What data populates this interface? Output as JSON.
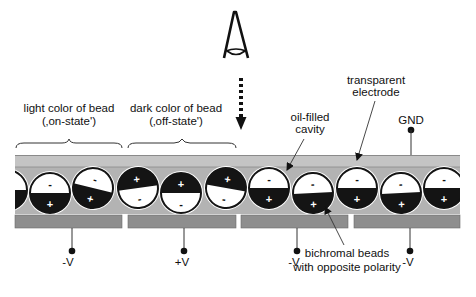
{
  "labels": {
    "on_state_line1": "light color of bead",
    "on_state_line2": "(‚on-state')",
    "off_state_line1": "dark color of bead",
    "off_state_line2": "(‚off-state')",
    "transparent_electrode_line1": "transparent",
    "transparent_electrode_line2": "electrode",
    "oil_cavity_line1": "oil-filled",
    "oil_cavity_line2": "cavity",
    "gnd": "GND",
    "beads_line1": "bichromal beads",
    "beads_line2": "with opposite polarity"
  },
  "electrodes": [
    {
      "label": "-V",
      "x": 72
    },
    {
      "label": "+V",
      "x": 184
    },
    {
      "label": "-V",
      "x": 297
    },
    {
      "label": "-V",
      "x": 410
    }
  ],
  "colors": {
    "top_electrode": "#c4c4c4",
    "cavity": "#b3b3b3",
    "bottom_electrode": "#8e8e8e",
    "bead_dark": "#141414",
    "bead_light": "#ffffff"
  },
  "beads": [
    {
      "cx": 7,
      "cy": 190,
      "dark": "bottom",
      "tilt": 0
    },
    {
      "cx": 50,
      "cy": 193,
      "dark": "bottom",
      "tilt": 0
    },
    {
      "cx": 93,
      "cy": 188,
      "dark": "bottom",
      "tilt": 14
    },
    {
      "cx": 138,
      "cy": 188,
      "dark": "top",
      "tilt": -8
    },
    {
      "cx": 181,
      "cy": 193,
      "dark": "top",
      "tilt": 0
    },
    {
      "cx": 226,
      "cy": 188,
      "dark": "top",
      "tilt": 10
    },
    {
      "cx": 269,
      "cy": 188,
      "dark": "bottom",
      "tilt": 0
    },
    {
      "cx": 313,
      "cy": 193,
      "dark": "bottom",
      "tilt": -3
    },
    {
      "cx": 357,
      "cy": 188,
      "dark": "bottom",
      "tilt": 0
    },
    {
      "cx": 401,
      "cy": 193,
      "dark": "bottom",
      "tilt": -3
    },
    {
      "cx": 444,
      "cy": 188,
      "dark": "bottom",
      "tilt": 0
    }
  ]
}
